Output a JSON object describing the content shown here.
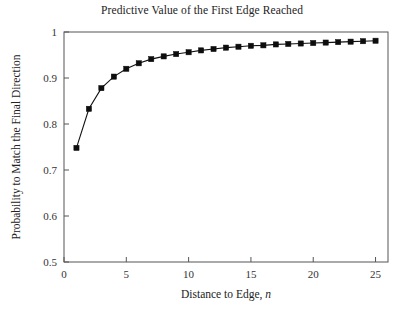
{
  "chart_data": {
    "type": "line",
    "title": "Predictive Value of the First Edge Reached",
    "xlabel_main": "Distance to Edge, ",
    "xlabel_italic": "n",
    "ylabel": "Probability to Match the Final Direction",
    "xlim": [
      0,
      26
    ],
    "ylim": [
      0.5,
      1.0
    ],
    "xticks": [
      0,
      5,
      10,
      15,
      20,
      25
    ],
    "xtick_labels": [
      "0",
      "5",
      "10",
      "15",
      "20",
      "25"
    ],
    "yticks": [
      0.5,
      0.6,
      0.7,
      0.8,
      0.9,
      1.0
    ],
    "ytick_labels": [
      "0.5",
      "0.6",
      "0.7",
      "0.8",
      "0.9",
      "1"
    ],
    "grid": false,
    "legend": false,
    "marker": "square",
    "marker_color": "#0d0d0d",
    "line_color": "#111111",
    "x": [
      1,
      2,
      3,
      4,
      5,
      6,
      7,
      8,
      9,
      10,
      11,
      12,
      13,
      14,
      15,
      16,
      17,
      18,
      19,
      20,
      21,
      22,
      23,
      24,
      25
    ],
    "y": [
      0.748,
      0.833,
      0.878,
      0.903,
      0.92,
      0.932,
      0.941,
      0.947,
      0.952,
      0.956,
      0.96,
      0.963,
      0.966,
      0.968,
      0.97,
      0.971,
      0.973,
      0.974,
      0.975,
      0.976,
      0.977,
      0.978,
      0.979,
      0.98,
      0.981
    ],
    "series_name": "Probability to match final direction"
  }
}
